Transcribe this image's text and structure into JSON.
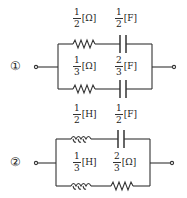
{
  "circuits": [
    {
      "label": "①",
      "top_branch": [
        {
          "type": "resistor",
          "num": "1",
          "den": "2",
          "unit": "[Ω]"
        },
        {
          "type": "capacitor",
          "num": "1",
          "den": "2",
          "unit": "[F]"
        }
      ],
      "bottom_branch": [
        {
          "type": "resistor",
          "num": "1",
          "den": "3",
          "unit": "[Ω]"
        },
        {
          "type": "capacitor",
          "num": "2",
          "den": "3",
          "unit": "[F]"
        }
      ]
    },
    {
      "label": "②",
      "top_branch": [
        {
          "type": "inductor",
          "num": "1",
          "den": "2",
          "unit": "[H]"
        },
        {
          "type": "capacitor",
          "num": "1",
          "den": "2",
          "unit": "[F]"
        }
      ],
      "bottom_branch": [
        {
          "type": "inductor",
          "num": "1",
          "den": "3",
          "unit": "[H]"
        },
        {
          "type": "resistor",
          "num": "2",
          "den": "3",
          "unit": "[Ω]"
        }
      ]
    }
  ],
  "colors": {
    "line": "#333333",
    "background": "#ffffff"
  }
}
